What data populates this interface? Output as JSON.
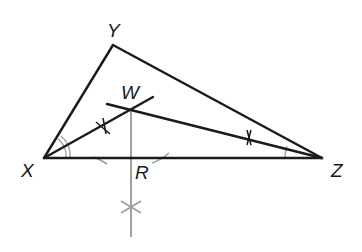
{
  "diagram": {
    "type": "geometry-construction",
    "colors": {
      "stroke": "#1a1a1a",
      "construction": "#a0a0a0",
      "background": "#ffffff"
    },
    "points": {
      "X": {
        "label": "X",
        "x": 44,
        "y": 158
      },
      "Y": {
        "label": "Y",
        "x": 113,
        "y": 45
      },
      "Z": {
        "label": "Z",
        "x": 322,
        "y": 158
      },
      "W": {
        "label": "W",
        "x": 131,
        "y": 110
      },
      "R": {
        "label": "R",
        "x": 131,
        "y": 158
      }
    },
    "labels": {
      "X": "X",
      "Y": "Y",
      "Z": "Z",
      "W": "W",
      "R": "R"
    },
    "segments": [
      {
        "from": "X",
        "to": "Y",
        "style": "solid"
      },
      {
        "from": "Y",
        "to": "Z",
        "style": "solid"
      },
      {
        "from": "X",
        "to": "Z",
        "style": "solid"
      },
      {
        "from": "X",
        "to": "W",
        "style": "solid",
        "note": "angle bisector of angle X, extended past W"
      },
      {
        "from": "W",
        "to": "Z",
        "style": "solid",
        "note": "angle bisector of angle Z, extended past W"
      },
      {
        "from": "W",
        "to": "R",
        "style": "construction",
        "note": "perpendicular from W to XZ, extended below"
      }
    ],
    "angle_marks": {
      "X": "double-arc",
      "Z": "single-arc"
    }
  }
}
